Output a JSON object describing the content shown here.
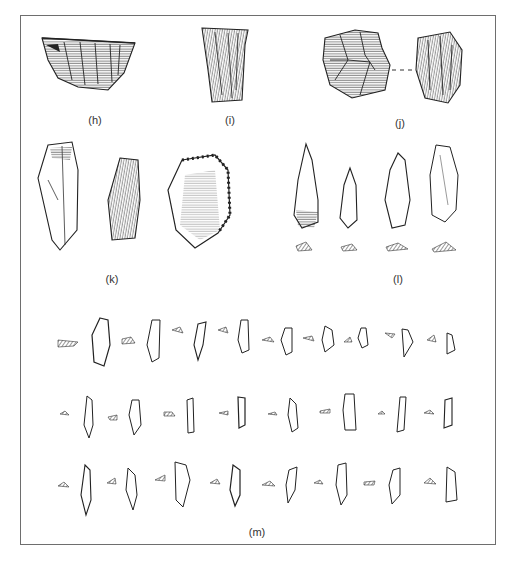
{
  "figure": {
    "panels": [
      {
        "id": "h",
        "label": "(h)",
        "label_pos": [
          95,
          120
        ]
      },
      {
        "id": "i",
        "label": "(i)",
        "label_pos": [
          230,
          120
        ]
      },
      {
        "id": "j",
        "label": "(j)",
        "label_pos": [
          400,
          123
        ]
      },
      {
        "id": "k",
        "label": "(k)",
        "label_pos": [
          112,
          279
        ]
      },
      {
        "id": "l",
        "label": "(l)",
        "label_pos": [
          398,
          279
        ]
      },
      {
        "id": "m",
        "label": "(m)",
        "label_pos": [
          257,
          530
        ]
      }
    ],
    "colors": {
      "ink": "#2a2a2a",
      "frame": "#6e6e6e",
      "hatch": "#555555",
      "background": "#ffffff"
    }
  }
}
